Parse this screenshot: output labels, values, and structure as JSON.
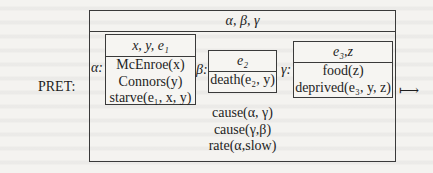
{
  "left_label": "PRET:",
  "outer_drs": {
    "universe": "α, β, γ",
    "conditions": [
      "cause(α, γ)",
      "cause(γ,β)",
      "rate(α,slow)"
    ]
  },
  "sub_drs": [
    {
      "label": "α:",
      "universe": "x, y, e₁",
      "conditions": [
        "McEnroe(x)",
        "Connors(y)",
        "starve(e₁, x, y)"
      ]
    },
    {
      "label": "β:",
      "universe": "e₂",
      "conditions": [
        "death(e₂, y)"
      ]
    },
    {
      "label": "γ:",
      "universe": "e₃,z",
      "conditions": [
        "food(z)",
        "deprived(e₃, y, z)"
      ]
    }
  ],
  "arrow_symbol": "⟼",
  "colors": {
    "line": "#3a3a3a",
    "text": "#1e1e1e",
    "paper": "#f4f3f0"
  }
}
